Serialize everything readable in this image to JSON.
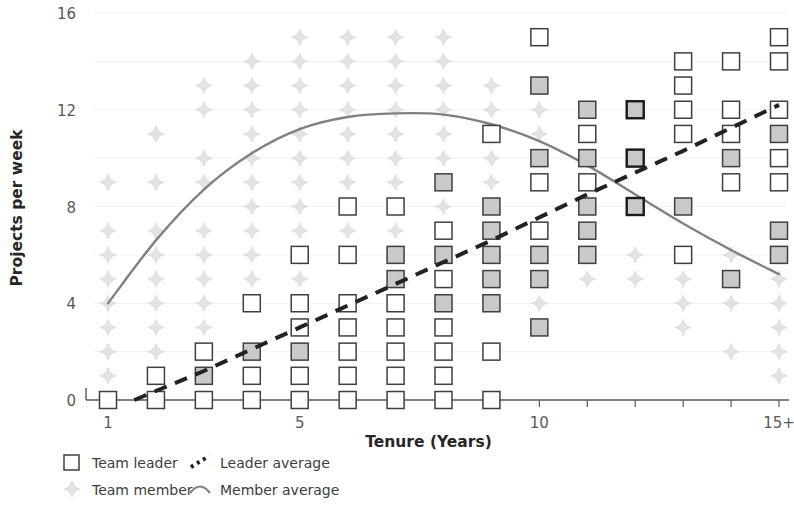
{
  "chart_data": {
    "type": "scatter",
    "title": "",
    "xlabel": "Tenure (Years)",
    "ylabel": "Projects per week",
    "xlim": [
      0.3,
      15.7
    ],
    "ylim": [
      0,
      16.6
    ],
    "xticks": [
      1,
      2,
      3,
      4,
      5,
      6,
      7,
      8,
      9,
      10,
      11,
      12,
      13,
      14,
      15
    ],
    "xtick_labels": [
      "1",
      "",
      "",
      "",
      "5",
      "",
      "",
      "",
      "",
      "10",
      "",
      "",
      "",
      "",
      "15+"
    ],
    "yticks": [
      0,
      4,
      8,
      12,
      16
    ],
    "ytick_labels": [
      "0",
      "4",
      "8",
      "12",
      "16"
    ],
    "y_minor_gridlines": [
      2,
      6,
      10,
      14
    ],
    "grid": true,
    "legend_position": "below-left",
    "colors": {
      "leader_marker_edge": "#3f3f3f",
      "leader_marker_fill": "#ffffff",
      "leader_marker_fill_shaded": "#c9c9c9",
      "leader_marker_edge_dark": "#1a1a1a",
      "member_marker": "#e3e3e3",
      "leader_average_line": "#222222",
      "member_average_line": "#808080",
      "axis": "#595959",
      "gridline": "#f0f0f0",
      "text": "#3d3d3d"
    },
    "legend": [
      {
        "key": "team-leader",
        "label": "Team leader",
        "marker": "square-open"
      },
      {
        "key": "team-member",
        "label": "Team member",
        "marker": "diamond-light"
      },
      {
        "key": "leader-average",
        "label": "Leader average",
        "marker": "dashed-line"
      },
      {
        "key": "member-average",
        "label": "Member average",
        "marker": "curve-line"
      }
    ],
    "series": [
      {
        "name": "Team leader",
        "marker": "square-open",
        "points": [
          {
            "x": 1,
            "y": 0,
            "shaded": false
          },
          {
            "x": 2,
            "y": 0,
            "shaded": false
          },
          {
            "x": 2,
            "y": 1,
            "shaded": false
          },
          {
            "x": 3,
            "y": 0,
            "shaded": false
          },
          {
            "x": 3,
            "y": 1,
            "shaded": true
          },
          {
            "x": 3,
            "y": 2,
            "shaded": false
          },
          {
            "x": 4,
            "y": 0,
            "shaded": false
          },
          {
            "x": 4,
            "y": 1,
            "shaded": false
          },
          {
            "x": 4,
            "y": 2,
            "shaded": true
          },
          {
            "x": 4,
            "y": 4,
            "shaded": false
          },
          {
            "x": 5,
            "y": 0,
            "shaded": false
          },
          {
            "x": 5,
            "y": 1,
            "shaded": false
          },
          {
            "x": 5,
            "y": 2,
            "shaded": true
          },
          {
            "x": 5,
            "y": 3,
            "shaded": false
          },
          {
            "x": 5,
            "y": 4,
            "shaded": false
          },
          {
            "x": 5,
            "y": 6,
            "shaded": false
          },
          {
            "x": 6,
            "y": 0,
            "shaded": false
          },
          {
            "x": 6,
            "y": 1,
            "shaded": false
          },
          {
            "x": 6,
            "y": 2,
            "shaded": false
          },
          {
            "x": 6,
            "y": 3,
            "shaded": false
          },
          {
            "x": 6,
            "y": 4,
            "shaded": false
          },
          {
            "x": 6,
            "y": 6,
            "shaded": false
          },
          {
            "x": 6,
            "y": 8,
            "shaded": false
          },
          {
            "x": 7,
            "y": 0,
            "shaded": false
          },
          {
            "x": 7,
            "y": 1,
            "shaded": false
          },
          {
            "x": 7,
            "y": 2,
            "shaded": false
          },
          {
            "x": 7,
            "y": 3,
            "shaded": false
          },
          {
            "x": 7,
            "y": 4,
            "shaded": false
          },
          {
            "x": 7,
            "y": 5,
            "shaded": true
          },
          {
            "x": 7,
            "y": 6,
            "shaded": true
          },
          {
            "x": 7,
            "y": 8,
            "shaded": false
          },
          {
            "x": 8,
            "y": 0,
            "shaded": false
          },
          {
            "x": 8,
            "y": 1,
            "shaded": false
          },
          {
            "x": 8,
            "y": 2,
            "shaded": false
          },
          {
            "x": 8,
            "y": 3,
            "shaded": false
          },
          {
            "x": 8,
            "y": 4,
            "shaded": true
          },
          {
            "x": 8,
            "y": 5,
            "shaded": false
          },
          {
            "x": 8,
            "y": 6,
            "shaded": true
          },
          {
            "x": 8,
            "y": 7,
            "shaded": false
          },
          {
            "x": 8,
            "y": 9,
            "shaded": true
          },
          {
            "x": 9,
            "y": 0,
            "shaded": false
          },
          {
            "x": 9,
            "y": 2,
            "shaded": false
          },
          {
            "x": 9,
            "y": 4,
            "shaded": true
          },
          {
            "x": 9,
            "y": 5,
            "shaded": true
          },
          {
            "x": 9,
            "y": 6,
            "shaded": true
          },
          {
            "x": 9,
            "y": 7,
            "shaded": true
          },
          {
            "x": 9,
            "y": 8,
            "shaded": true
          },
          {
            "x": 9,
            "y": 11,
            "shaded": false
          },
          {
            "x": 10,
            "y": 3,
            "shaded": true
          },
          {
            "x": 10,
            "y": 5,
            "shaded": true
          },
          {
            "x": 10,
            "y": 6,
            "shaded": true
          },
          {
            "x": 10,
            "y": 7,
            "shaded": false
          },
          {
            "x": 10,
            "y": 9,
            "shaded": false
          },
          {
            "x": 10,
            "y": 10,
            "shaded": true
          },
          {
            "x": 10,
            "y": 13,
            "shaded": true
          },
          {
            "x": 10,
            "y": 15,
            "shaded": false
          },
          {
            "x": 11,
            "y": 6,
            "shaded": true
          },
          {
            "x": 11,
            "y": 7,
            "shaded": true
          },
          {
            "x": 11,
            "y": 8,
            "shaded": true
          },
          {
            "x": 11,
            "y": 9,
            "shaded": false
          },
          {
            "x": 11,
            "y": 10,
            "shaded": true
          },
          {
            "x": 11,
            "y": 11,
            "shaded": false
          },
          {
            "x": 11,
            "y": 12,
            "shaded": true
          },
          {
            "x": 12,
            "y": 8,
            "shaded": true,
            "dark": true
          },
          {
            "x": 12,
            "y": 10,
            "shaded": true,
            "dark": true
          },
          {
            "x": 12,
            "y": 12,
            "shaded": true,
            "dark": true
          },
          {
            "x": 13,
            "y": 6,
            "shaded": false
          },
          {
            "x": 13,
            "y": 8,
            "shaded": true
          },
          {
            "x": 13,
            "y": 11,
            "shaded": false
          },
          {
            "x": 13,
            "y": 12,
            "shaded": false
          },
          {
            "x": 13,
            "y": 13,
            "shaded": false
          },
          {
            "x": 13,
            "y": 14,
            "shaded": false
          },
          {
            "x": 14,
            "y": 5,
            "shaded": true
          },
          {
            "x": 14,
            "y": 9,
            "shaded": false
          },
          {
            "x": 14,
            "y": 10,
            "shaded": true
          },
          {
            "x": 14,
            "y": 11,
            "shaded": false
          },
          {
            "x": 14,
            "y": 12,
            "shaded": false
          },
          {
            "x": 14,
            "y": 14,
            "shaded": false
          },
          {
            "x": 15,
            "y": 6,
            "shaded": true
          },
          {
            "x": 15,
            "y": 7,
            "shaded": true
          },
          {
            "x": 15,
            "y": 9,
            "shaded": false
          },
          {
            "x": 15,
            "y": 10,
            "shaded": false
          },
          {
            "x": 15,
            "y": 11,
            "shaded": true
          },
          {
            "x": 15,
            "y": 12,
            "shaded": false
          },
          {
            "x": 15,
            "y": 14,
            "shaded": false
          },
          {
            "x": 15,
            "y": 15,
            "shaded": false
          }
        ]
      },
      {
        "name": "Team member",
        "marker": "diamond-light",
        "points": [
          {
            "x": 1,
            "y": 1
          },
          {
            "x": 1,
            "y": 2
          },
          {
            "x": 1,
            "y": 3
          },
          {
            "x": 1,
            "y": 4
          },
          {
            "x": 1,
            "y": 5
          },
          {
            "x": 1,
            "y": 6
          },
          {
            "x": 1,
            "y": 7
          },
          {
            "x": 1,
            "y": 9
          },
          {
            "x": 2,
            "y": 1
          },
          {
            "x": 2,
            "y": 2
          },
          {
            "x": 2,
            "y": 3
          },
          {
            "x": 2,
            "y": 4
          },
          {
            "x": 2,
            "y": 5
          },
          {
            "x": 2,
            "y": 6
          },
          {
            "x": 2,
            "y": 7
          },
          {
            "x": 2,
            "y": 9
          },
          {
            "x": 2,
            "y": 11
          },
          {
            "x": 3,
            "y": 2
          },
          {
            "x": 3,
            "y": 3
          },
          {
            "x": 3,
            "y": 4
          },
          {
            "x": 3,
            "y": 5
          },
          {
            "x": 3,
            "y": 6
          },
          {
            "x": 3,
            "y": 7
          },
          {
            "x": 3,
            "y": 9
          },
          {
            "x": 3,
            "y": 10
          },
          {
            "x": 3,
            "y": 12
          },
          {
            "x": 3,
            "y": 13
          },
          {
            "x": 4,
            "y": 4
          },
          {
            "x": 4,
            "y": 5
          },
          {
            "x": 4,
            "y": 6
          },
          {
            "x": 4,
            "y": 7
          },
          {
            "x": 4,
            "y": 8
          },
          {
            "x": 4,
            "y": 9
          },
          {
            "x": 4,
            "y": 10
          },
          {
            "x": 4,
            "y": 11
          },
          {
            "x": 4,
            "y": 12
          },
          {
            "x": 4,
            "y": 13
          },
          {
            "x": 4,
            "y": 14
          },
          {
            "x": 5,
            "y": 5
          },
          {
            "x": 5,
            "y": 6
          },
          {
            "x": 5,
            "y": 7
          },
          {
            "x": 5,
            "y": 8
          },
          {
            "x": 5,
            "y": 9
          },
          {
            "x": 5,
            "y": 10
          },
          {
            "x": 5,
            "y": 11
          },
          {
            "x": 5,
            "y": 12
          },
          {
            "x": 5,
            "y": 13
          },
          {
            "x": 5,
            "y": 14
          },
          {
            "x": 5,
            "y": 15
          },
          {
            "x": 6,
            "y": 6
          },
          {
            "x": 6,
            "y": 7
          },
          {
            "x": 6,
            "y": 9
          },
          {
            "x": 6,
            "y": 10
          },
          {
            "x": 6,
            "y": 11
          },
          {
            "x": 6,
            "y": 12
          },
          {
            "x": 6,
            "y": 13
          },
          {
            "x": 6,
            "y": 14
          },
          {
            "x": 6,
            "y": 15
          },
          {
            "x": 7,
            "y": 7
          },
          {
            "x": 7,
            "y": 9
          },
          {
            "x": 7,
            "y": 10
          },
          {
            "x": 7,
            "y": 11
          },
          {
            "x": 7,
            "y": 12
          },
          {
            "x": 7,
            "y": 13
          },
          {
            "x": 7,
            "y": 14
          },
          {
            "x": 7,
            "y": 15
          },
          {
            "x": 8,
            "y": 8
          },
          {
            "x": 8,
            "y": 10
          },
          {
            "x": 8,
            "y": 11
          },
          {
            "x": 8,
            "y": 12
          },
          {
            "x": 8,
            "y": 13
          },
          {
            "x": 8,
            "y": 14
          },
          {
            "x": 8,
            "y": 15
          },
          {
            "x": 9,
            "y": 9
          },
          {
            "x": 9,
            "y": 10
          },
          {
            "x": 9,
            "y": 12
          },
          {
            "x": 9,
            "y": 13
          },
          {
            "x": 10,
            "y": 4
          },
          {
            "x": 10,
            "y": 11
          },
          {
            "x": 10,
            "y": 12
          },
          {
            "x": 11,
            "y": 5
          },
          {
            "x": 12,
            "y": 5
          },
          {
            "x": 12,
            "y": 6
          },
          {
            "x": 13,
            "y": 3
          },
          {
            "x": 13,
            "y": 4
          },
          {
            "x": 13,
            "y": 5
          },
          {
            "x": 13,
            "y": 6
          },
          {
            "x": 14,
            "y": 2
          },
          {
            "x": 14,
            "y": 4
          },
          {
            "x": 14,
            "y": 5
          },
          {
            "x": 14,
            "y": 6
          },
          {
            "x": 15,
            "y": 1
          },
          {
            "x": 15,
            "y": 2
          },
          {
            "x": 15,
            "y": 3
          },
          {
            "x": 15,
            "y": 4
          },
          {
            "x": 15,
            "y": 5
          }
        ]
      }
    ],
    "trendlines": [
      {
        "name": "Leader average",
        "style": "dashed",
        "points": [
          {
            "x": 1.55,
            "y": 0
          },
          {
            "x": 3,
            "y": 1.2
          },
          {
            "x": 5,
            "y": 3.0
          },
          {
            "x": 7,
            "y": 4.8
          },
          {
            "x": 9,
            "y": 6.6
          },
          {
            "x": 11,
            "y": 8.5
          },
          {
            "x": 13,
            "y": 10.3
          },
          {
            "x": 15,
            "y": 12.2
          }
        ]
      },
      {
        "name": "Member average",
        "style": "solid-curve",
        "points": [
          {
            "x": 1,
            "y": 4.0
          },
          {
            "x": 2,
            "y": 6.6
          },
          {
            "x": 3,
            "y": 8.7
          },
          {
            "x": 4,
            "y": 10.2
          },
          {
            "x": 5,
            "y": 11.2
          },
          {
            "x": 6,
            "y": 11.7
          },
          {
            "x": 7,
            "y": 11.85
          },
          {
            "x": 8,
            "y": 11.8
          },
          {
            "x": 9,
            "y": 11.4
          },
          {
            "x": 10,
            "y": 10.7
          },
          {
            "x": 11,
            "y": 9.7
          },
          {
            "x": 12,
            "y": 8.5
          },
          {
            "x": 13,
            "y": 7.3
          },
          {
            "x": 14,
            "y": 6.2
          },
          {
            "x": 15,
            "y": 5.2
          }
        ]
      }
    ]
  }
}
